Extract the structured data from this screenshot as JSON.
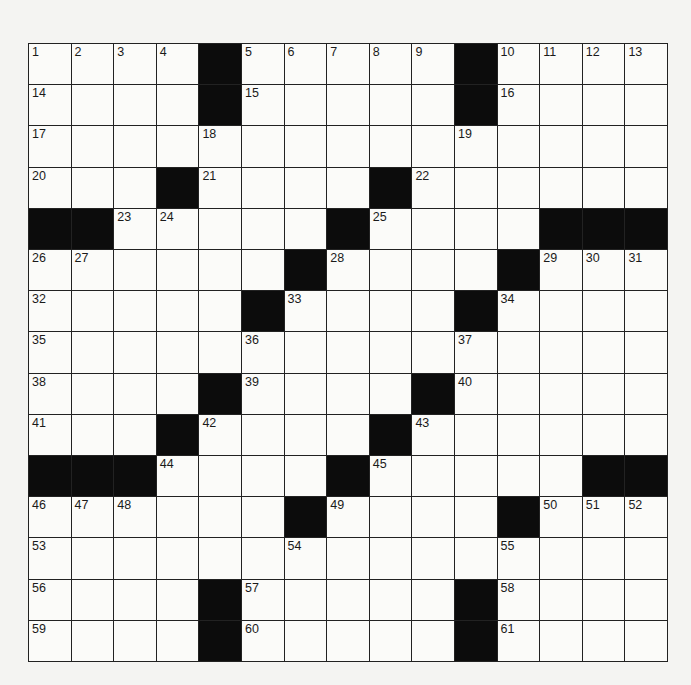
{
  "puzzle": {
    "size": {
      "rows": 15,
      "cols": 15
    },
    "grid": [
      [
        "1",
        "2",
        "3",
        "4",
        "#",
        "5",
        "6",
        "7",
        "8",
        "9",
        "#",
        "10",
        "11",
        "12",
        "13"
      ],
      [
        "14",
        "",
        "",
        "",
        "#",
        "15",
        "",
        "",
        "",
        "",
        "#",
        "16",
        "",
        "",
        ""
      ],
      [
        "17",
        "",
        "",
        "",
        "18",
        "",
        "",
        "",
        "",
        "",
        "19",
        "",
        "",
        "",
        ""
      ],
      [
        "20",
        "",
        "",
        "#",
        "21",
        "",
        "",
        "",
        "#",
        "22",
        "",
        "",
        "",
        "",
        ""
      ],
      [
        "#",
        "#",
        "23",
        "24",
        "",
        "",
        "",
        "#",
        "25",
        "",
        "",
        "",
        "#",
        "#",
        "#"
      ],
      [
        "26",
        "27",
        "",
        "",
        "",
        "",
        "#",
        "28",
        "",
        "",
        "",
        "#",
        "29",
        "30",
        "31"
      ],
      [
        "32",
        "",
        "",
        "",
        "",
        "#",
        "33",
        "",
        "",
        "",
        "#",
        "34",
        "",
        "",
        ""
      ],
      [
        "35",
        "",
        "",
        "",
        "",
        "36",
        "",
        "",
        "",
        "",
        "37",
        "",
        "",
        "",
        ""
      ],
      [
        "38",
        "",
        "",
        "",
        "#",
        "39",
        "",
        "",
        "",
        "#",
        "40",
        "",
        "",
        "",
        ""
      ],
      [
        "41",
        "",
        "",
        "#",
        "42",
        "",
        "",
        "",
        "#",
        "43",
        "",
        "",
        "",
        "",
        ""
      ],
      [
        "#",
        "#",
        "#",
        "44",
        "",
        "",
        "",
        "#",
        "45",
        "",
        "",
        "",
        "",
        "#",
        "#"
      ],
      [
        "46",
        "47",
        "48",
        "",
        "",
        "",
        "#",
        "49",
        "",
        "",
        "",
        "#",
        "50",
        "51",
        "52"
      ],
      [
        "53",
        "",
        "",
        "",
        "",
        "",
        "54",
        "",
        "",
        "",
        "",
        "55",
        "",
        "",
        ""
      ],
      [
        "56",
        "",
        "",
        "",
        "#",
        "57",
        "",
        "",
        "",
        "",
        "#",
        "58",
        "",
        "",
        ""
      ],
      [
        "59",
        "",
        "",
        "",
        "#",
        "60",
        "",
        "",
        "",
        "",
        "#",
        "61",
        "",
        "",
        ""
      ]
    ],
    "colors": {
      "block": "#0c0c0c",
      "cell": "#fbfbf9",
      "line": "#222222",
      "paper": "#f4f4f2"
    }
  }
}
